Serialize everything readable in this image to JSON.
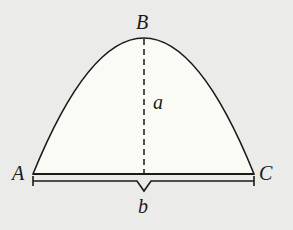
{
  "diagram": {
    "labels": {
      "A": "A",
      "B": "B",
      "C": "C",
      "a": "a",
      "b": "b"
    },
    "colors": {
      "background": "#ebebe9",
      "fill": "#fbfbf6",
      "stroke": "#1a1a1a"
    }
  }
}
